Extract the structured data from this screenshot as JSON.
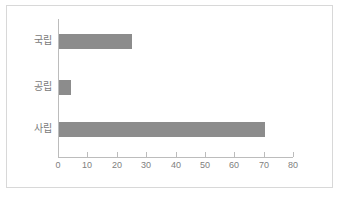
{
  "chart_data": {
    "type": "bar",
    "orientation": "horizontal",
    "title": "",
    "subtitle": "",
    "xlabel": "",
    "ylabel": "",
    "categories": [
      "국립",
      "공립",
      "사립"
    ],
    "values": [
      25,
      4,
      70
    ],
    "series": [
      {
        "name": "",
        "values": [
          25,
          4,
          70
        ]
      }
    ],
    "xlim": [
      0,
      80
    ],
    "xticks": [
      0,
      10,
      20,
      30,
      40,
      50,
      60,
      70,
      80
    ],
    "xtick_labels": [
      "0",
      "10",
      "20",
      "30",
      "40",
      "50",
      "60",
      "70",
      "80"
    ],
    "ytick_labels": [
      "국립",
      "공립",
      "사립"
    ],
    "grid": false,
    "legend": false,
    "legend_position": "none",
    "bar_color": "#8c8c8c",
    "axis_color": "#bcbcbc",
    "tick_label_color": "#808080",
    "category_label_color": "#7a7a7a",
    "frame_color": "#d8d8d8",
    "background_color": "#ffffff",
    "annotations": []
  },
  "figure": {
    "width": 343,
    "height": 200
  }
}
